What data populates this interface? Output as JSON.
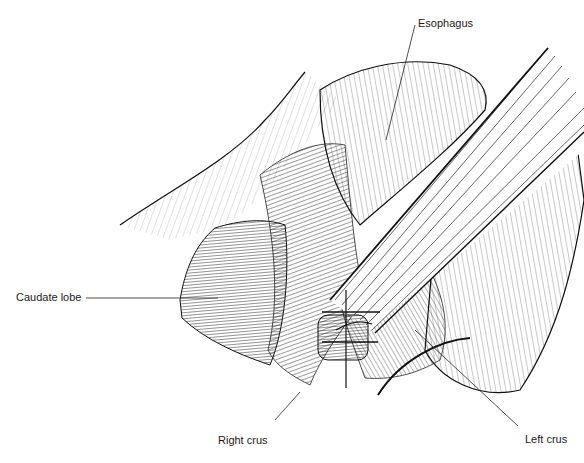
{
  "figure": {
    "type": "anatomical line illustration",
    "labels": {
      "esophagus": "Esophagus",
      "caudate_lobe": "Caudate lobe",
      "right_crus": "Right crus",
      "left_crus": "Left crus"
    }
  }
}
